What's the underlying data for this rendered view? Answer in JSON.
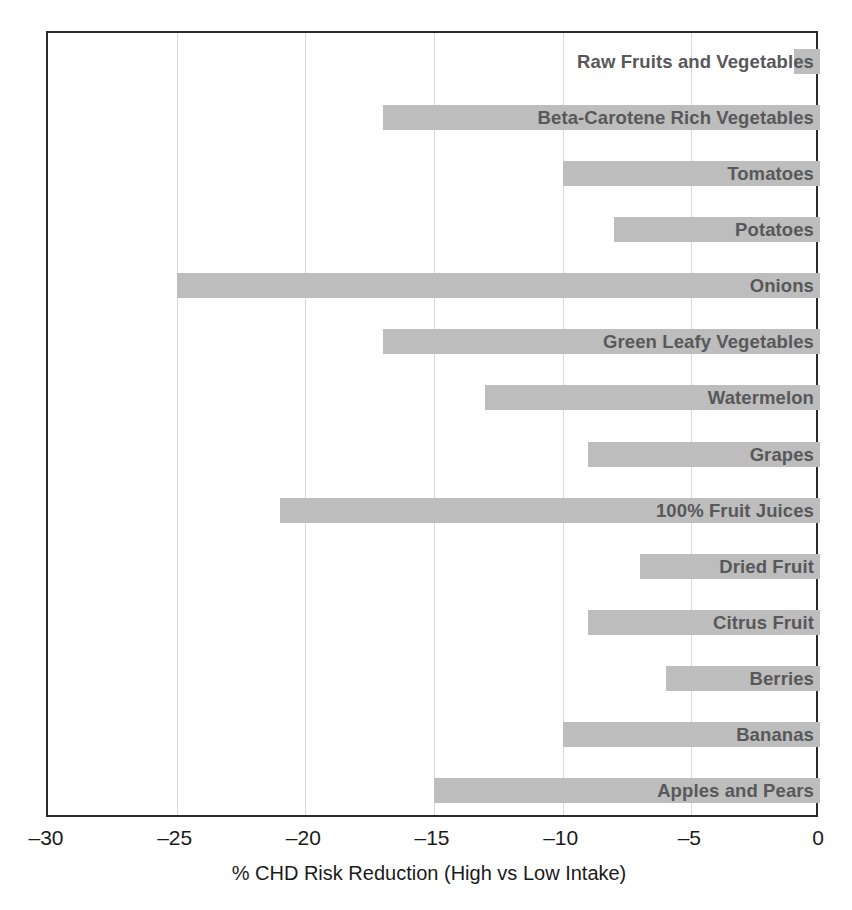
{
  "chart_data": {
    "type": "bar",
    "orientation": "horizontal",
    "title": "",
    "subtitle": "",
    "xlabel": "% CHD Risk Reduction (High vs Low Intake)",
    "ylabel": "",
    "xlim": [
      -30,
      0
    ],
    "xticks": [
      -30,
      -25,
      -20,
      -15,
      -10,
      -5,
      0
    ],
    "xticklabels": [
      "–30",
      "–25",
      "–20",
      "–15",
      "–10",
      "–5",
      "0"
    ],
    "grid": true,
    "grid_axis": "x",
    "legend": "none",
    "bar_color": "#bdbdbd",
    "label_color": "#58585a",
    "axis_color": "#2b2b2b",
    "categories": [
      "Raw Fruits and Vegetables",
      "Beta-Carotene Rich Vegetables",
      "Tomatoes",
      "Potatoes",
      "Onions",
      "Green Leafy Vegetables",
      "Watermelon",
      "Grapes",
      "100% Fruit Juices",
      "Dried Fruit",
      "Citrus Fruit",
      "Berries",
      "Bananas",
      "Apples and Pears"
    ],
    "values": [
      -1,
      -17,
      -10,
      -8,
      -25,
      -17,
      -13,
      -9,
      -21,
      -7,
      -9,
      -6,
      -10,
      -15
    ],
    "bars": [
      {
        "label": "Raw Fruits and Vegetables",
        "value": -1
      },
      {
        "label": "Beta-Carotene Rich Vegetables",
        "value": -17
      },
      {
        "label": "Tomatoes",
        "value": -10
      },
      {
        "label": "Potatoes",
        "value": -8
      },
      {
        "label": "Onions",
        "value": -25
      },
      {
        "label": "Green Leafy Vegetables",
        "value": -17
      },
      {
        "label": "Watermelon",
        "value": -13
      },
      {
        "label": "Grapes",
        "value": -9
      },
      {
        "label": "100% Fruit Juices",
        "value": -21
      },
      {
        "label": "Dried Fruit",
        "value": -7
      },
      {
        "label": "Citrus Fruit",
        "value": -9
      },
      {
        "label": "Berries",
        "value": -6
      },
      {
        "label": "Bananas",
        "value": -10
      },
      {
        "label": "Apples and Pears",
        "value": -15
      }
    ]
  }
}
